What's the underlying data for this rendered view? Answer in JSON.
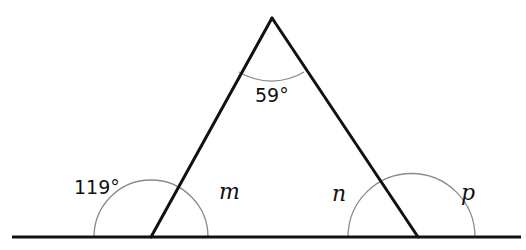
{
  "diagram": {
    "type": "triangle-exterior-angles",
    "colors": {
      "line": "#111111",
      "arc": "#8a8a8a",
      "background": "#ffffff"
    },
    "baseline": {
      "x1": 12,
      "x2": 521,
      "y": 237
    },
    "vertices": {
      "apex": {
        "x": 272,
        "y": 18
      },
      "left": {
        "x": 151,
        "y": 237
      },
      "right": {
        "x": 418,
        "y": 237
      }
    },
    "labels": {
      "apex_angle": "59°",
      "left_exterior_angle": "119°",
      "left_interior_angle": "m",
      "right_interior_angle": "n",
      "right_exterior_angle": "p"
    }
  }
}
